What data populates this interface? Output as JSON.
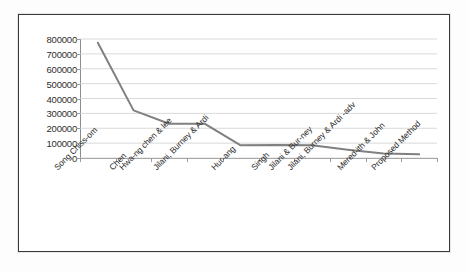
{
  "chart_data": {
    "type": "line",
    "title": "",
    "subtitle": "",
    "xlabel": "",
    "ylabel": "",
    "categories": [
      "Song Chiss-om",
      "Chen",
      "Hwa-ng chen & lee",
      "Jilani, Burney & Ardi",
      "Hur-ang",
      "Singh",
      "Jilani & Bur-ney",
      "Jilani, Burney & Ardi -adv",
      "Mered-ith & John",
      "Proposed Method"
    ],
    "values": [
      775000,
      320000,
      230000,
      230000,
      85000,
      88000,
      85000,
      55000,
      30000,
      25000
    ],
    "series": [
      {
        "name": "",
        "values": [
          775000,
          320000,
          230000,
          230000,
          85000,
          88000,
          85000,
          55000,
          30000,
          25000
        ],
        "color": "#808080"
      }
    ],
    "ylim": [
      0,
      800000
    ],
    "xlim": [
      0,
      10
    ],
    "y_ticks": [
      0,
      100000,
      200000,
      300000,
      400000,
      500000,
      600000,
      700000,
      800000
    ],
    "y_tick_labels": [
      "0",
      "100000",
      "200000",
      "300000",
      "400000",
      "500000",
      "600000",
      "700000",
      "800000"
    ],
    "grid": true,
    "grid_axis": "y",
    "grid_color": "#cfcfcf",
    "legend": false,
    "legend_position": "none",
    "line_color": "#808080",
    "line_width": 2,
    "markers": false,
    "background_color": "#ffffff",
    "frame_color": "#3a3a3a",
    "axis_color": "#8c8c8c",
    "x_label_rotation": -45
  }
}
